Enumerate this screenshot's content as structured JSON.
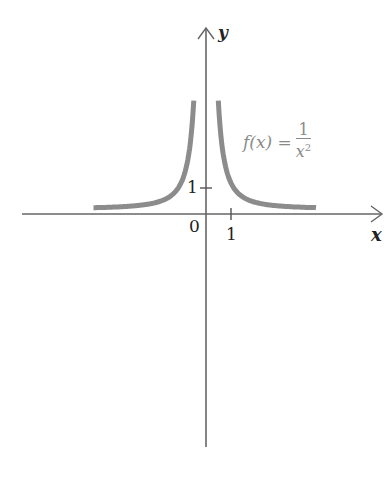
{
  "chart_data": {
    "type": "line",
    "title": "",
    "function_label": "f(x) = 1/x^2",
    "xlabel": "x",
    "ylabel": "y",
    "origin_label": "0",
    "x_ticks": [
      1
    ],
    "y_ticks": [
      1
    ],
    "x_tick_labels": [
      "1"
    ],
    "y_tick_labels": [
      "1"
    ],
    "xlim": [
      -7.4,
      7.1
    ],
    "ylim": [
      -8.9,
      6.4
    ],
    "series": [
      {
        "name": "f(x) = 1/x^2",
        "color": "#8c8c8c",
        "branches": [
          {
            "x": [
              -4.5,
              -3,
              -2,
              -1.5,
              -1,
              -0.75,
              -0.6,
              -0.5,
              -0.4
            ],
            "y": [
              0.049,
              0.111,
              0.25,
              0.444,
              1,
              1.778,
              2.778,
              4,
              6.25
            ]
          },
          {
            "x": [
              0.4,
              0.5,
              0.6,
              0.75,
              1,
              1.5,
              2,
              3,
              4.4
            ],
            "y": [
              6.25,
              4,
              2.778,
              1.778,
              1,
              0.444,
              0.25,
              0.111,
              0.052
            ]
          }
        ]
      }
    ],
    "grid": false,
    "legend": "annotation near right branch"
  },
  "labels": {
    "y_axis": "y",
    "x_axis": "x",
    "origin": "0",
    "x_tick": "1",
    "y_tick": "1",
    "fn_prefix": "f(x) =",
    "fn_num": "1",
    "fn_den": "x",
    "fn_exp": "2"
  },
  "colors": {
    "curve": "#8c8c8c",
    "axis": "#555555"
  }
}
